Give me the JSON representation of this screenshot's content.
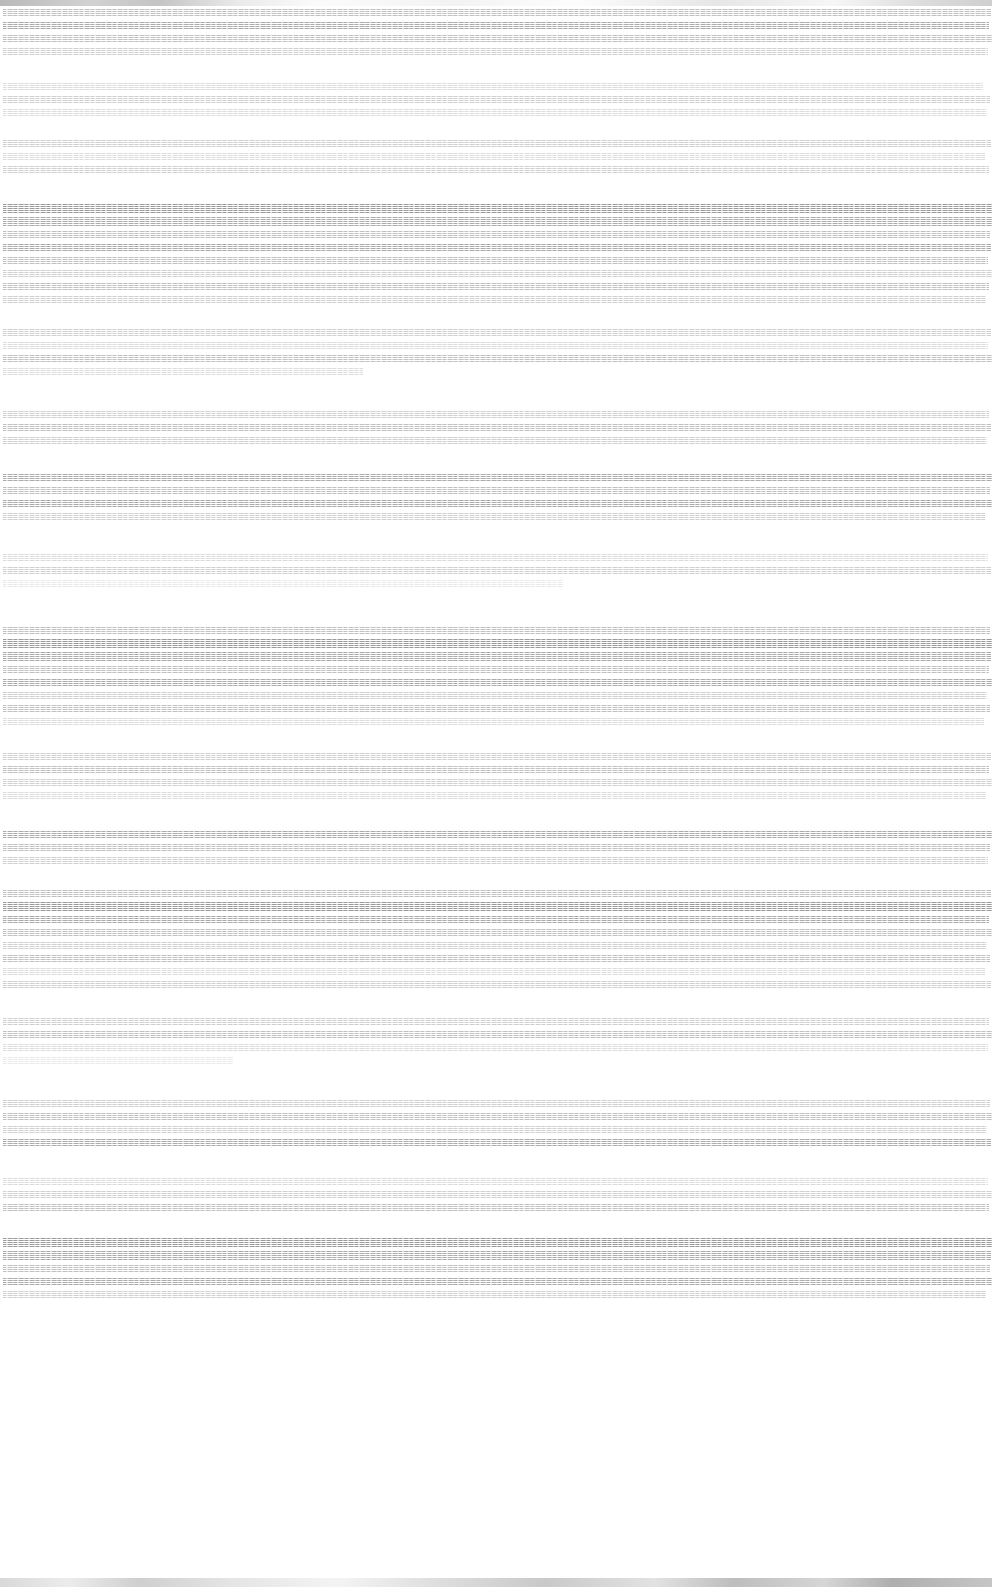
{
  "window": {
    "titlebar": {
      "present": true,
      "height_px": 6,
      "description": "degraded-gray-gradient-titlebar"
    },
    "statusbar": {
      "present": true,
      "height_px": 9,
      "description": "degraded-gray-gradient-statusbar"
    },
    "width_px": 992,
    "height_px": 1587
  },
  "document": {
    "condition": "severely-degraded",
    "note": "Horizontal interlacing/scanline corruption has destroyed all glyph detail; no text strings are recoverable from the pixels.",
    "text_left_px": 3,
    "text_right_px": 990,
    "line_pitch_px": 13,
    "colors": {
      "page_background": "#ffffff",
      "ink_faint": "#e9e9e9",
      "ink_light": "#dcdcdc",
      "ink_normal": "#cfcfcf",
      "ink_medium": "#c0c0c0",
      "ink_strong": "#ababab",
      "ink_heavy": "#9a9a9a",
      "chrome_gray": "#c9c9c9"
    },
    "blocks": [
      {
        "gap_px": 0,
        "lines": [
          {
            "width_px": 988,
            "weight": "w-medium"
          },
          {
            "width_px": 986,
            "weight": "w-strong"
          },
          {
            "width_px": 989,
            "weight": "w-medium"
          },
          {
            "width_px": 985,
            "weight": "w-normal"
          }
        ]
      },
      {
        "gap_px": 22,
        "lines": [
          {
            "width_px": 980,
            "weight": "w-light"
          },
          {
            "width_px": 987,
            "weight": "w-normal"
          },
          {
            "width_px": 984,
            "weight": "w-light"
          }
        ]
      },
      {
        "gap_px": 18,
        "lines": [
          {
            "width_px": 988,
            "weight": "w-normal"
          },
          {
            "width_px": 982,
            "weight": "w-light"
          },
          {
            "width_px": 986,
            "weight": "w-normal"
          }
        ]
      },
      {
        "gap_px": 26,
        "lines": [
          {
            "width_px": 990,
            "weight": "w-heavy",
            "emphasis": true
          },
          {
            "width_px": 989,
            "weight": "w-strong",
            "emphasis": true
          },
          {
            "width_px": 987,
            "weight": "w-medium"
          },
          {
            "width_px": 988,
            "weight": "w-strong"
          },
          {
            "width_px": 985,
            "weight": "w-medium"
          },
          {
            "width_px": 989,
            "weight": "w-normal"
          },
          {
            "width_px": 986,
            "weight": "w-medium"
          },
          {
            "width_px": 983,
            "weight": "w-normal"
          }
        ]
      },
      {
        "gap_px": 20,
        "lines": [
          {
            "width_px": 988,
            "weight": "w-normal"
          },
          {
            "width_px": 985,
            "weight": "w-light"
          },
          {
            "width_px": 989,
            "weight": "w-medium"
          },
          {
            "width_px": 360,
            "weight": "w-light"
          }
        ]
      },
      {
        "gap_px": 30,
        "lines": [
          {
            "width_px": 986,
            "weight": "w-normal"
          },
          {
            "width_px": 988,
            "weight": "w-medium"
          },
          {
            "width_px": 984,
            "weight": "w-normal"
          }
        ]
      },
      {
        "gap_px": 24,
        "lines": [
          {
            "width_px": 989,
            "weight": "w-strong"
          },
          {
            "width_px": 987,
            "weight": "w-medium"
          },
          {
            "width_px": 990,
            "weight": "w-strong"
          },
          {
            "width_px": 982,
            "weight": "w-normal"
          }
        ]
      },
      {
        "gap_px": 28,
        "lines": [
          {
            "width_px": 985,
            "weight": "w-light"
          },
          {
            "width_px": 988,
            "weight": "w-normal"
          },
          {
            "width_px": 560,
            "weight": "w-faint"
          }
        ]
      },
      {
        "gap_px": 34,
        "lines": [
          {
            "width_px": 987,
            "weight": "w-medium"
          },
          {
            "width_px": 990,
            "weight": "w-heavy",
            "emphasis": true
          },
          {
            "width_px": 988,
            "weight": "w-strong",
            "emphasis": true
          },
          {
            "width_px": 986,
            "weight": "w-medium"
          },
          {
            "width_px": 989,
            "weight": "w-strong"
          },
          {
            "width_px": 984,
            "weight": "w-normal"
          },
          {
            "width_px": 987,
            "weight": "w-medium"
          },
          {
            "width_px": 981,
            "weight": "w-light"
          }
        ]
      },
      {
        "gap_px": 22,
        "lines": [
          {
            "width_px": 988,
            "weight": "w-normal"
          },
          {
            "width_px": 986,
            "weight": "w-medium"
          },
          {
            "width_px": 989,
            "weight": "w-normal"
          },
          {
            "width_px": 983,
            "weight": "w-light"
          }
        ]
      },
      {
        "gap_px": 26,
        "lines": [
          {
            "width_px": 990,
            "weight": "w-strong"
          },
          {
            "width_px": 987,
            "weight": "w-medium"
          },
          {
            "width_px": 985,
            "weight": "w-normal"
          }
        ]
      },
      {
        "gap_px": 20,
        "lines": [
          {
            "width_px": 988,
            "weight": "w-medium"
          },
          {
            "width_px": 990,
            "weight": "w-heavy",
            "emphasis": true
          },
          {
            "width_px": 986,
            "weight": "w-strong"
          },
          {
            "width_px": 989,
            "weight": "w-medium"
          },
          {
            "width_px": 984,
            "weight": "w-normal"
          },
          {
            "width_px": 987,
            "weight": "w-medium"
          },
          {
            "width_px": 982,
            "weight": "w-light"
          },
          {
            "width_px": 988,
            "weight": "w-normal"
          }
        ]
      },
      {
        "gap_px": 24,
        "lines": [
          {
            "width_px": 986,
            "weight": "w-normal"
          },
          {
            "width_px": 989,
            "weight": "w-medium"
          },
          {
            "width_px": 985,
            "weight": "w-light"
          },
          {
            "width_px": 230,
            "weight": "w-faint"
          }
        ]
      },
      {
        "gap_px": 30,
        "lines": [
          {
            "width_px": 987,
            "weight": "w-normal"
          },
          {
            "width_px": 990,
            "weight": "w-medium"
          },
          {
            "width_px": 984,
            "weight": "w-normal"
          },
          {
            "width_px": 988,
            "weight": "w-strong"
          }
        ]
      },
      {
        "gap_px": 26,
        "lines": [
          {
            "width_px": 985,
            "weight": "w-light"
          },
          {
            "width_px": 989,
            "weight": "w-normal"
          },
          {
            "width_px": 986,
            "weight": "w-medium"
          }
        ]
      },
      {
        "gap_px": 22,
        "lines": [
          {
            "width_px": 990,
            "weight": "w-heavy",
            "emphasis": true
          },
          {
            "width_px": 988,
            "weight": "w-strong",
            "emphasis": true
          },
          {
            "width_px": 987,
            "weight": "w-medium"
          },
          {
            "width_px": 989,
            "weight": "w-strong"
          },
          {
            "width_px": 983,
            "weight": "w-normal"
          }
        ]
      }
    ]
  }
}
